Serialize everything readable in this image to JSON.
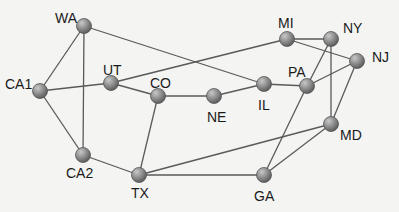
{
  "diagram": {
    "type": "network-graph",
    "node_color": "#8a8a8a",
    "edge_color": "#5a5a5a",
    "nodes": [
      {
        "id": "WA",
        "label": "WA",
        "x": 84,
        "y": 26,
        "lx": 55,
        "ly": 11
      },
      {
        "id": "CA1",
        "label": "CA1",
        "x": 40,
        "y": 91,
        "lx": 5,
        "ly": 77
      },
      {
        "id": "UT",
        "label": "UT",
        "x": 111,
        "y": 83,
        "lx": 103,
        "ly": 63
      },
      {
        "id": "CO",
        "label": "CO",
        "x": 158,
        "y": 96,
        "lx": 150,
        "ly": 76
      },
      {
        "id": "NE",
        "label": "NE",
        "x": 214,
        "y": 96,
        "lx": 207,
        "ly": 110
      },
      {
        "id": "IL",
        "label": "IL",
        "x": 264,
        "y": 84,
        "lx": 258,
        "ly": 98
      },
      {
        "id": "PA",
        "label": "PA",
        "x": 307,
        "y": 86,
        "lx": 288,
        "ly": 65
      },
      {
        "id": "MI",
        "label": "MI",
        "x": 287,
        "y": 39,
        "lx": 278,
        "ly": 16
      },
      {
        "id": "NY",
        "label": "NY",
        "x": 331,
        "y": 39,
        "lx": 343,
        "ly": 21
      },
      {
        "id": "NJ",
        "label": "NJ",
        "x": 357,
        "y": 61,
        "lx": 372,
        "ly": 50
      },
      {
        "id": "MD",
        "label": "MD",
        "x": 331,
        "y": 124,
        "lx": 340,
        "ly": 128
      },
      {
        "id": "CA2",
        "label": "CA2",
        "x": 83,
        "y": 155,
        "lx": 66,
        "ly": 166
      },
      {
        "id": "TX",
        "label": "TX",
        "x": 139,
        "y": 175,
        "lx": 131,
        "ly": 186
      },
      {
        "id": "GA",
        "label": "GA",
        "x": 264,
        "y": 175,
        "lx": 254,
        "ly": 189
      }
    ],
    "edges": [
      [
        "WA",
        "CA1"
      ],
      [
        "WA",
        "CA2"
      ],
      [
        "WA",
        "IL"
      ],
      [
        "CA1",
        "UT"
      ],
      [
        "CA1",
        "CA2"
      ],
      [
        "UT",
        "CO"
      ],
      [
        "UT",
        "MI"
      ],
      [
        "CO",
        "NE"
      ],
      [
        "CO",
        "TX"
      ],
      [
        "NE",
        "IL"
      ],
      [
        "IL",
        "PA"
      ],
      [
        "PA",
        "NJ"
      ],
      [
        "PA",
        "NY"
      ],
      [
        "PA",
        "GA"
      ],
      [
        "MI",
        "NY"
      ],
      [
        "MI",
        "NJ"
      ],
      [
        "NY",
        "MD"
      ],
      [
        "NJ",
        "MD"
      ],
      [
        "MD",
        "TX"
      ],
      [
        "MD",
        "GA"
      ],
      [
        "CA2",
        "TX"
      ],
      [
        "TX",
        "GA"
      ]
    ]
  }
}
